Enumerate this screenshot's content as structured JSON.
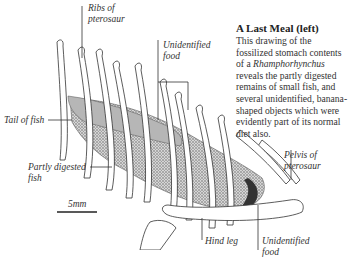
{
  "figure": {
    "caption": {
      "title": "A Last Meal (left)",
      "body_before": "This drawing of the fossilized stomach contents of a ",
      "genus": "Rhamphorhynchus",
      "body_after": " reveals the partly digested remains of small fish, and several unidentified, banana-shaped objects which were evidently part of its normal diet also."
    },
    "labels": {
      "ribs": [
        "Ribs of",
        "pterosaur"
      ],
      "unidentified_food_top": [
        "Unidentified",
        "food"
      ],
      "tail_of_fish": "Tail of fish",
      "partly_digested": [
        "Partly digested",
        "fish"
      ],
      "pelvis": [
        "Pelvis of",
        "pterosaur"
      ],
      "hind_leg": "Hind leg",
      "unidentified_food_bottom": [
        "Unidentified",
        "food"
      ]
    },
    "scale_bar": {
      "label": "5mm"
    },
    "colors": {
      "ink": "#333333",
      "stipple": "#555555",
      "background": "#ffffff"
    }
  }
}
